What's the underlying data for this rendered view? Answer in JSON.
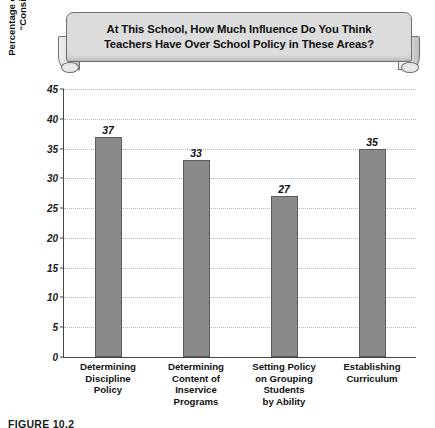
{
  "banner": {
    "title": "At This School, How Much Influence Do You Think\nTeachers Have Over School Policy in These Areas?"
  },
  "caption": {
    "text": "FIGURE 10.2"
  },
  "chart_data": {
    "type": "bar",
    "title": "At This School, How Much Influence Do You Think Teachers Have Over School Policy in These Areas?",
    "categories": [
      "Determining\nDiscipline\nPolicy",
      "Determining\nContent of\nInservice\nPrograms",
      "Setting Policy\non Grouping\nStudents\nby Ability",
      "Establishing\nCurriculum"
    ],
    "values": [
      37,
      33,
      27,
      35
    ],
    "value_labels": [
      "37",
      "33",
      "27",
      "35"
    ],
    "xlabel": "",
    "ylabel": "Percentage of Teachers Responding\n“Considerable Influence”",
    "ylim": [
      0,
      45
    ],
    "ytick_step": 5,
    "yticks": [
      0,
      5,
      10,
      15,
      20,
      25,
      30,
      35,
      40,
      45
    ],
    "ytick_labels": [
      "0",
      "5",
      "10",
      "15",
      "20",
      "25",
      "30",
      "35",
      "40",
      "45"
    ],
    "grid": true,
    "grid_style": "dotted",
    "legend": null,
    "bar_color": "#8a8a8a",
    "bar_border_color": "#5a5a5a",
    "axis_color": "#444444",
    "grid_color": "#b9b9b9",
    "banner_color": "#dcdcdc",
    "text_color": "#111111"
  }
}
